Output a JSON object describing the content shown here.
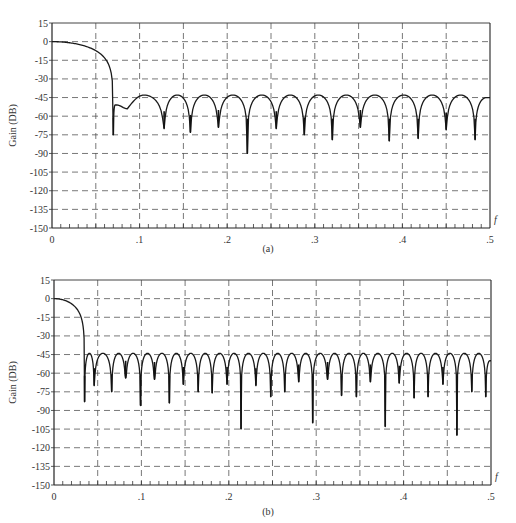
{
  "chart_data": [
    {
      "id": "a",
      "type": "line",
      "caption": "(a)",
      "xlabel": "f",
      "ylabel": "Gain (DB)",
      "xlim": [
        0,
        0.5
      ],
      "ylim": [
        -150,
        15
      ],
      "xticks": [
        0,
        0.1,
        0.2,
        0.3,
        0.4,
        0.5
      ],
      "xtick_labels": [
        "0",
        ".1",
        ".2",
        ".3",
        ".4",
        ".5"
      ],
      "yticks": [
        15,
        0,
        -15,
        -30,
        -45,
        -60,
        -75,
        -90,
        -105,
        -120,
        -135,
        -150
      ],
      "ytick_labels": [
        "15",
        "0",
        "-15",
        "-30",
        "-45",
        "-60",
        "-75",
        "-90",
        "-105",
        "-120",
        "-135",
        "-150"
      ],
      "grid": {
        "x": [
          0.05,
          0.1,
          0.15,
          0.2,
          0.25,
          0.3,
          0.35,
          0.4,
          0.45
        ],
        "y": [
          0,
          -15,
          -30,
          -45,
          -60,
          -75,
          -90,
          -105,
          -120,
          -135
        ],
        "style": "dashed"
      },
      "main_lobe": {
        "null_f": 0.07,
        "null_db": -75
      },
      "shoulder": [
        {
          "f": 0.074,
          "db": -51
        },
        {
          "f": 0.086,
          "db": -54
        }
      ],
      "nulls": [
        {
          "f": 0.128,
          "db": -70
        },
        {
          "f": 0.158,
          "db": -73
        },
        {
          "f": 0.19,
          "db": -69
        },
        {
          "f": 0.223,
          "db": -90
        },
        {
          "f": 0.256,
          "db": -70
        },
        {
          "f": 0.288,
          "db": -75
        },
        {
          "f": 0.32,
          "db": -79
        },
        {
          "f": 0.352,
          "db": -69
        },
        {
          "f": 0.385,
          "db": -80
        },
        {
          "f": 0.418,
          "db": -78
        },
        {
          "f": 0.45,
          "db": -71
        },
        {
          "f": 0.483,
          "db": -79
        }
      ],
      "sidelobe_peak_db": -43,
      "end_db": -45
    },
    {
      "id": "b",
      "type": "line",
      "caption": "(b)",
      "xlabel": "f",
      "ylabel": "Gain (DB)",
      "xlim": [
        0,
        0.5
      ],
      "ylim": [
        -150,
        15
      ],
      "xticks": [
        0,
        0.1,
        0.2,
        0.3,
        0.4,
        0.5
      ],
      "xtick_labels": [
        "0",
        ".1",
        ".2",
        ".3",
        ".4",
        ".5"
      ],
      "yticks": [
        15,
        0,
        -15,
        -30,
        -45,
        -60,
        -75,
        -90,
        -105,
        -120,
        -135,
        -150
      ],
      "ytick_labels": [
        "15",
        "0",
        "-15",
        "-30",
        "-45",
        "-60",
        "-75",
        "-90",
        "-105",
        "-120",
        "-135",
        "-150"
      ],
      "grid": {
        "x": [
          0.05,
          0.1,
          0.15,
          0.2,
          0.25,
          0.3,
          0.35,
          0.4,
          0.45
        ],
        "y": [
          0,
          -15,
          -30,
          -45,
          -60,
          -75,
          -90,
          -105,
          -120,
          -135
        ],
        "style": "dashed"
      },
      "main_lobe": {
        "null_f": 0.035,
        "null_db": -83
      },
      "nulls": [
        {
          "f": 0.046,
          "db": -70
        },
        {
          "f": 0.066,
          "db": -75
        },
        {
          "f": 0.082,
          "db": -64
        },
        {
          "f": 0.099,
          "db": -86
        },
        {
          "f": 0.115,
          "db": -65
        },
        {
          "f": 0.132,
          "db": -84
        },
        {
          "f": 0.148,
          "db": -69
        },
        {
          "f": 0.165,
          "db": -75
        },
        {
          "f": 0.181,
          "db": -76
        },
        {
          "f": 0.198,
          "db": -69
        },
        {
          "f": 0.214,
          "db": -105
        },
        {
          "f": 0.231,
          "db": -70
        },
        {
          "f": 0.248,
          "db": -79
        },
        {
          "f": 0.264,
          "db": -75
        },
        {
          "f": 0.28,
          "db": -67
        },
        {
          "f": 0.296,
          "db": -100
        },
        {
          "f": 0.313,
          "db": -65
        },
        {
          "f": 0.329,
          "db": -78
        },
        {
          "f": 0.346,
          "db": -79
        },
        {
          "f": 0.362,
          "db": -67
        },
        {
          "f": 0.379,
          "db": -103
        },
        {
          "f": 0.395,
          "db": -68
        },
        {
          "f": 0.412,
          "db": -80
        },
        {
          "f": 0.428,
          "db": -79
        },
        {
          "f": 0.445,
          "db": -69
        },
        {
          "f": 0.461,
          "db": -110
        },
        {
          "f": 0.478,
          "db": -75
        },
        {
          "f": 0.494,
          "db": -79
        }
      ],
      "sidelobe_peak_db": -44,
      "end_db": -50
    }
  ]
}
